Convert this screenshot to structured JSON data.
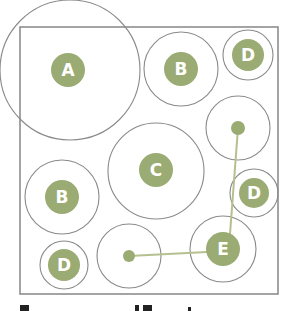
{
  "diagram": {
    "frame": {
      "x": 20,
      "y": 27,
      "width": 258,
      "height": 267,
      "stroke": "#8e8e8e"
    },
    "colors": {
      "badge_fill": "#9aab74",
      "badge_text": "#ffffff",
      "outline": "#8a8a8a",
      "connector": "#b5c08f",
      "background": "#ffffff"
    },
    "nodes": [
      {
        "id": "A",
        "label": "A",
        "cx": 70,
        "cy": 70,
        "outer_r": 70,
        "badge_cx": 68,
        "badge_cy": 70,
        "badge_r": 17
      },
      {
        "id": "B1",
        "label": "B",
        "cx": 181,
        "cy": 69,
        "outer_r": 37,
        "badge_cx": 181,
        "badge_cy": 69,
        "badge_r": 17
      },
      {
        "id": "D1",
        "label": "D",
        "cx": 248,
        "cy": 55,
        "outer_r": 25,
        "badge_cx": 248,
        "badge_cy": 55,
        "badge_r": 16
      },
      {
        "id": "C",
        "label": "C",
        "cx": 156,
        "cy": 171,
        "outer_r": 48,
        "badge_cx": 156,
        "badge_cy": 170,
        "badge_r": 17
      },
      {
        "id": "B2",
        "label": "B",
        "cx": 62,
        "cy": 197,
        "outer_r": 37,
        "badge_cx": 62,
        "badge_cy": 197,
        "badge_r": 17
      },
      {
        "id": "D2",
        "label": "D",
        "cx": 254,
        "cy": 193,
        "outer_r": 24,
        "badge_cx": 254,
        "badge_cy": 193,
        "badge_r": 15
      },
      {
        "id": "D3",
        "label": "D",
        "cx": 64,
        "cy": 265,
        "outer_r": 24,
        "badge_cx": 64,
        "badge_cy": 265,
        "badge_r": 16
      },
      {
        "id": "E",
        "label": "E",
        "cx": 223,
        "cy": 249,
        "outer_r": 33,
        "badge_cx": 223,
        "badge_cy": 249,
        "badge_r": 17
      }
    ],
    "dots": [
      {
        "id": "dot-top-right",
        "cx": 238,
        "cy": 128,
        "outer_r": 32,
        "dot_r": 7
      },
      {
        "id": "dot-bottom",
        "cx": 129,
        "cy": 256,
        "outer_r": 32,
        "dot_r": 6
      }
    ],
    "connectors": [
      {
        "from": "dot-top-right",
        "to": "E",
        "x1": 238,
        "y1": 128,
        "x2": 230,
        "y2": 234
      },
      {
        "from": "dot-bottom",
        "to": "E",
        "x1": 129,
        "y1": 256,
        "x2": 207,
        "y2": 252
      }
    ]
  }
}
